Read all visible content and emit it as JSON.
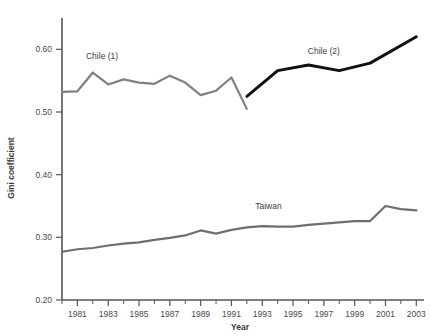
{
  "chart_data": {
    "type": "line",
    "title": "",
    "xlabel": "Year",
    "ylabel": "Gini coefficient",
    "xlim": [
      1980,
      2003.5
    ],
    "ylim": [
      0.2,
      0.65
    ],
    "grid": false,
    "legend": "inline-annotations",
    "ytick_labels": [
      "0.20",
      "0.30",
      "0.40",
      "0.50",
      "0.60"
    ],
    "ytick_values": [
      0.2,
      0.3,
      0.4,
      0.5,
      0.6
    ],
    "xtick_labels": [
      "1981",
      "1983",
      "1985",
      "1987",
      "1989",
      "1991",
      "1993",
      "1995",
      "1997",
      "1999",
      "2001",
      "2003"
    ],
    "xtick_values": [
      1981,
      1983,
      1985,
      1987,
      1989,
      1991,
      1993,
      1995,
      1997,
      1999,
      2001,
      2003
    ],
    "xtick_minor_values": [
      1980,
      1982,
      1984,
      1986,
      1988,
      1990,
      1992,
      1994,
      1996,
      1998,
      2000,
      2002
    ],
    "annotations": [
      {
        "text": "Chile (1)",
        "x": 1982.6,
        "y": 0.585
      },
      {
        "text": "Chile (2)",
        "x": 1997.0,
        "y": 0.592
      },
      {
        "text": "Taiwan",
        "x": 1993.4,
        "y": 0.346
      }
    ],
    "series": [
      {
        "name": "Chile (1)",
        "color": "#808080",
        "x": [
          1980,
          1981,
          1982,
          1983,
          1984,
          1985,
          1986,
          1987,
          1988,
          1989,
          1990,
          1991,
          1992
        ],
        "values": [
          0.532,
          0.533,
          0.563,
          0.544,
          0.552,
          0.547,
          0.545,
          0.558,
          0.547,
          0.527,
          0.534,
          0.555,
          0.505
        ]
      },
      {
        "name": "Chile (2)",
        "color": "#111111",
        "x": [
          1992,
          1994,
          1996,
          1998,
          2000,
          2003
        ],
        "values": [
          0.525,
          0.566,
          0.575,
          0.566,
          0.578,
          0.62
        ]
      },
      {
        "name": "Taiwan",
        "color": "#6e6e6e",
        "x": [
          1980,
          1981,
          1982,
          1983,
          1984,
          1985,
          1986,
          1987,
          1988,
          1989,
          1990,
          1991,
          1992,
          1993,
          1994,
          1995,
          1996,
          1997,
          1998,
          1999,
          2000,
          2001,
          2002,
          2003
        ],
        "values": [
          0.277,
          0.281,
          0.283,
          0.287,
          0.29,
          0.292,
          0.296,
          0.299,
          0.303,
          0.311,
          0.306,
          0.312,
          0.316,
          0.318,
          0.317,
          0.317,
          0.32,
          0.322,
          0.324,
          0.326,
          0.326,
          0.35,
          0.345,
          0.343
        ]
      }
    ]
  }
}
